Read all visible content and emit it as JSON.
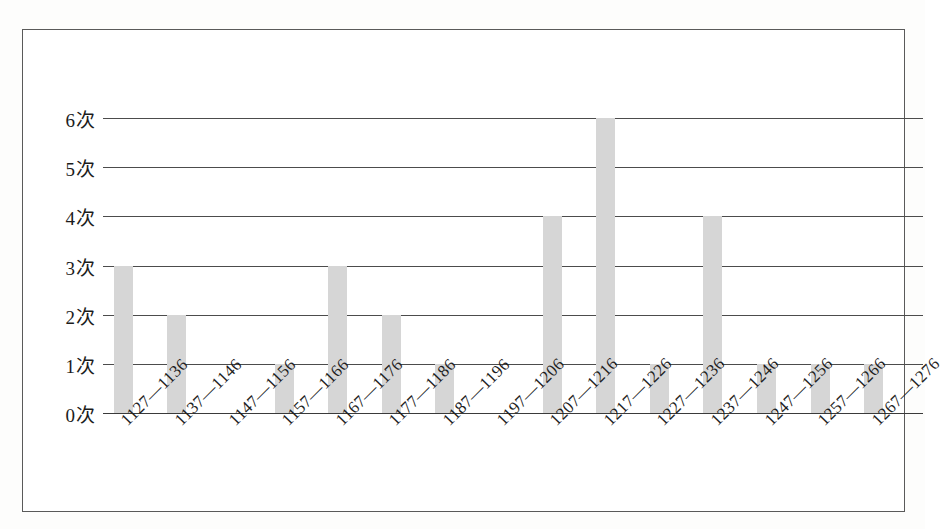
{
  "chart_data": {
    "type": "bar",
    "title": "",
    "subtitle": "",
    "xlabel": "",
    "ylabel": "",
    "ylim": [
      0,
      6
    ],
    "grid": true,
    "legend": false,
    "categories": [
      "1127—1136",
      "1137—1146",
      "1147—1156",
      "1157—1166",
      "1167—1176",
      "1177—1186",
      "1187—1196",
      "1197—1206",
      "1207—1216",
      "1217—1226",
      "1227—1236",
      "1237—1246",
      "1247—1256",
      "1257—1266",
      "1267—1276"
    ],
    "values": [
      3,
      2,
      0,
      1,
      3,
      2,
      1,
      0,
      4,
      6,
      1,
      4,
      1,
      1,
      1
    ],
    "y_tick_labels": [
      "0次",
      "1次",
      "2次",
      "3次",
      "4次",
      "5次",
      "6次"
    ],
    "y_tick_values": [
      0,
      1,
      2,
      3,
      4,
      5,
      6
    ],
    "bar_color": "#d6d6d6",
    "gridline_color": "#4c4c4c",
    "axis_color": "#3a3a3a",
    "frame_color": "#5a5a5a",
    "background_color": "#ffffff"
  }
}
